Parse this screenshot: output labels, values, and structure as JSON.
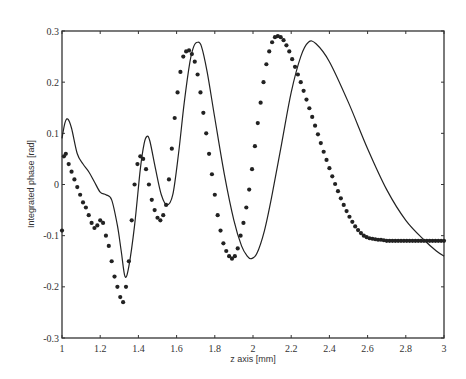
{
  "chart_data": {
    "type": "line",
    "title": "",
    "xlabel": "z axis [mm]",
    "ylabel": "Integrated phase [rad]",
    "xlim": [
      1,
      3
    ],
    "ylim": [
      -0.3,
      0.3
    ],
    "x_ticks": [
      1,
      1.2,
      1.4,
      1.6,
      1.8,
      2,
      2.2,
      2.4,
      2.6,
      2.8,
      3
    ],
    "x_tick_labels": [
      "1",
      "1.2",
      "1.4",
      "1.6",
      "1.8",
      "2",
      "2.2",
      "2.4",
      "2.6",
      "2.8",
      "3"
    ],
    "y_ticks": [
      0.3,
      0.2,
      0.1,
      0,
      -0.1,
      -0.2,
      -0.3
    ],
    "y_tick_labels": [
      "0.3",
      "0.2",
      "0.1",
      "0",
      "-0.1",
      "-0.2",
      "-0.3"
    ],
    "grid": false,
    "series": [
      {
        "name": "solid",
        "style": "line",
        "color": "#222222",
        "x": [
          1.0,
          1.015,
          1.03,
          1.05,
          1.08,
          1.11,
          1.14,
          1.17,
          1.2,
          1.23,
          1.26,
          1.29,
          1.31,
          1.33,
          1.35,
          1.38,
          1.41,
          1.43,
          1.445,
          1.46,
          1.49,
          1.52,
          1.55,
          1.58,
          1.61,
          1.64,
          1.67,
          1.69,
          1.71,
          1.73,
          1.76,
          1.8,
          1.85,
          1.9,
          1.94,
          1.97,
          1.99,
          2.02,
          2.06,
          2.1,
          2.15,
          2.2,
          2.25,
          2.29,
          2.33,
          2.4,
          2.5,
          2.6,
          2.7,
          2.8,
          2.9,
          2.96,
          3.0
        ],
        "y": [
          0.09,
          0.12,
          0.128,
          0.11,
          0.06,
          0.04,
          0.025,
          0.005,
          -0.015,
          -0.02,
          -0.03,
          -0.08,
          -0.13,
          -0.18,
          -0.16,
          -0.08,
          0.03,
          0.08,
          0.094,
          0.085,
          0.03,
          -0.02,
          -0.04,
          -0.02,
          0.06,
          0.16,
          0.24,
          0.27,
          0.278,
          0.27,
          0.22,
          0.13,
          0.02,
          -0.07,
          -0.12,
          -0.14,
          -0.145,
          -0.135,
          -0.09,
          -0.02,
          0.08,
          0.18,
          0.25,
          0.278,
          0.275,
          0.24,
          0.16,
          0.07,
          -0.01,
          -0.07,
          -0.11,
          -0.13,
          -0.14
        ]
      },
      {
        "name": "dots",
        "style": "markers",
        "color": "#222222",
        "x": [
          1.0,
          1.01,
          1.02,
          1.035,
          1.05,
          1.065,
          1.08,
          1.095,
          1.11,
          1.125,
          1.14,
          1.155,
          1.17,
          1.185,
          1.2,
          1.215,
          1.23,
          1.245,
          1.26,
          1.275,
          1.29,
          1.305,
          1.32,
          1.335,
          1.35,
          1.365,
          1.38,
          1.395,
          1.41,
          1.425,
          1.44,
          1.455,
          1.47,
          1.485,
          1.5,
          1.515,
          1.53,
          1.545,
          1.56,
          1.575,
          1.59,
          1.605,
          1.62,
          1.635,
          1.65,
          1.665,
          1.68,
          1.695,
          1.71,
          1.725,
          1.74,
          1.755,
          1.77,
          1.785,
          1.8,
          1.815,
          1.83,
          1.845,
          1.86,
          1.875,
          1.89,
          1.905,
          1.92,
          1.935,
          1.95,
          1.965,
          1.98,
          1.995,
          2.01,
          2.025,
          2.04,
          2.055,
          2.07,
          2.085,
          2.1,
          2.115,
          2.13,
          2.145,
          2.16,
          2.175,
          2.19,
          2.205,
          2.22,
          2.235,
          2.25,
          2.265,
          2.28,
          2.295,
          2.31,
          2.325,
          2.34,
          2.355,
          2.37,
          2.385,
          2.4,
          2.415,
          2.43,
          2.445,
          2.46,
          2.475,
          2.49,
          2.505,
          2.52,
          2.535,
          2.55,
          2.565,
          2.58,
          2.595,
          2.61,
          2.625,
          2.64,
          2.655,
          2.67,
          2.685,
          2.7,
          2.715,
          2.73,
          2.745,
          2.76,
          2.775,
          2.79,
          2.805,
          2.82,
          2.835,
          2.85,
          2.865,
          2.88,
          2.895,
          2.91,
          2.925,
          2.94,
          2.955,
          2.97,
          2.985,
          3.0
        ],
        "y": [
          -0.09,
          0.055,
          0.06,
          0.04,
          0.025,
          0.01,
          -0.005,
          -0.02,
          -0.035,
          -0.045,
          -0.06,
          -0.075,
          -0.085,
          -0.08,
          -0.07,
          -0.075,
          -0.1,
          -0.12,
          -0.15,
          -0.18,
          -0.2,
          -0.22,
          -0.23,
          -0.2,
          -0.15,
          -0.07,
          0.0,
          0.04,
          0.055,
          0.05,
          0.03,
          0.0,
          -0.03,
          -0.05,
          -0.065,
          -0.07,
          -0.06,
          -0.04,
          0.01,
          0.07,
          0.13,
          0.18,
          0.22,
          0.25,
          0.26,
          0.262,
          0.255,
          0.24,
          0.215,
          0.18,
          0.14,
          0.1,
          0.06,
          0.02,
          -0.02,
          -0.06,
          -0.09,
          -0.115,
          -0.13,
          -0.14,
          -0.145,
          -0.14,
          -0.125,
          -0.1,
          -0.075,
          -0.045,
          -0.01,
          0.03,
          0.075,
          0.12,
          0.16,
          0.2,
          0.235,
          0.26,
          0.278,
          0.288,
          0.29,
          0.288,
          0.282,
          0.272,
          0.26,
          0.245,
          0.23,
          0.215,
          0.2,
          0.183,
          0.166,
          0.149,
          0.132,
          0.115,
          0.098,
          0.081,
          0.064,
          0.048,
          0.032,
          0.016,
          0.001,
          -0.013,
          -0.027,
          -0.04,
          -0.052,
          -0.063,
          -0.073,
          -0.082,
          -0.089,
          -0.095,
          -0.1,
          -0.103,
          -0.105,
          -0.106,
          -0.107,
          -0.108,
          -0.108,
          -0.109,
          -0.11,
          -0.11,
          -0.11,
          -0.11,
          -0.11,
          -0.11,
          -0.11,
          -0.11,
          -0.11,
          -0.11,
          -0.11,
          -0.11,
          -0.11,
          -0.11,
          -0.11,
          -0.11,
          -0.11,
          -0.11,
          -0.11,
          -0.11,
          -0.11
        ]
      }
    ]
  }
}
